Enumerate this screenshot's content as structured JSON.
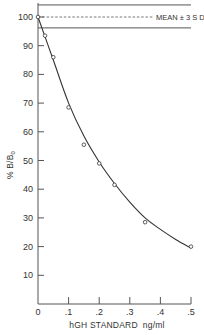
{
  "chart_data": {
    "type": "line",
    "title": "",
    "xlabel": "hGH STANDARD  ng/ml",
    "ylabel": "% B/B",
    "ylabel_subscript": "0",
    "xlim": [
      0,
      0.5
    ],
    "ylim": [
      0,
      100
    ],
    "x_ticks": [
      0,
      0.1,
      0.2,
      0.3,
      0.4,
      0.5
    ],
    "x_tick_labels": [
      "0",
      ".1",
      ".2",
      ".3",
      ".4",
      ".5"
    ],
    "y_ticks": [
      10,
      20,
      30,
      40,
      50,
      60,
      70,
      80,
      90,
      100
    ],
    "y_tick_labels": [
      "10",
      "20",
      "30",
      "40",
      "50",
      "60",
      "70",
      "80",
      "90",
      "100"
    ],
    "grid": false,
    "legend": null,
    "series": [
      {
        "name": "hGH standard curve",
        "marker": "open-circle",
        "x": [
          0,
          0.023,
          0.05,
          0.1,
          0.15,
          0.2,
          0.25,
          0.35,
          0.5
        ],
        "y": [
          100,
          93.5,
          86,
          68.5,
          55.5,
          49,
          41.5,
          28.5,
          20
        ]
      }
    ],
    "fit_curve": {
      "x": [
        0,
        0.05,
        0.1,
        0.15,
        0.2,
        0.25,
        0.3,
        0.35,
        0.4,
        0.45,
        0.5
      ],
      "y": [
        100,
        85,
        70,
        58.5,
        49.5,
        42,
        35.5,
        30,
        26,
        22.5,
        19.5
      ]
    },
    "reference_band": {
      "label": "MEAN ± 3 S D",
      "mean": 100,
      "upper": 104.2,
      "lower": 96.2
    },
    "colors": {
      "line": "#333333",
      "axis": "#555555",
      "background": "#ffffff"
    }
  }
}
